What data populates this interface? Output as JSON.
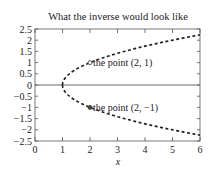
{
  "chart_data": {
    "type": "line",
    "title": "What the inverse would look like",
    "xlabel": "x",
    "ylabel": "",
    "xlim": [
      0,
      6
    ],
    "ylim": [
      -2.5,
      2.5
    ],
    "x_ticks": [
      "0",
      "1",
      "2",
      "3",
      "4",
      "5",
      "6"
    ],
    "y_ticks": [
      "2.5",
      "2",
      "1.5",
      "1",
      "0.5",
      "0",
      "−0.5",
      "−1",
      "−1.5",
      "−2",
      "−2.5"
    ],
    "grid": false,
    "series": [
      {
        "name": "upper branch y = sqrt(x-1)",
        "style": "dashed",
        "x": [
          1,
          1.25,
          2,
          3,
          4,
          5,
          6
        ],
        "values": [
          0,
          0.5,
          1,
          1.414,
          1.732,
          2,
          2.236
        ]
      },
      {
        "name": "lower branch y = -sqrt(x-1)",
        "style": "dashed",
        "x": [
          1,
          1.25,
          2,
          3,
          4,
          5,
          6
        ],
        "values": [
          0,
          -0.5,
          -1,
          -1.414,
          -1.732,
          -2,
          -2.236
        ]
      }
    ],
    "annotations": [
      {
        "x": 2,
        "y": 1,
        "text": "the point (2, 1)"
      },
      {
        "x": 2,
        "y": -1,
        "text": "the point (2, −1)"
      }
    ]
  }
}
